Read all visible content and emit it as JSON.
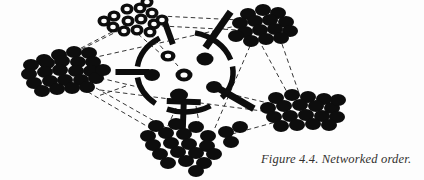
{
  "figure": {
    "caption": "Figure 4.4. Networked order.",
    "label": "Figure 4.4.",
    "title": "Networked order",
    "alt": "Networked order diagram: five peripheral clusters of dots linked by thin dashed lines around a central broken circle with thick radial spokes"
  },
  "colors": {
    "background": "#fdfdfd",
    "ink": "#0d0d0d",
    "dashed_line": "#2b2b2b",
    "caption_text": "#33312f",
    "ring_fill": "#fdfdfd"
  },
  "diagram": {
    "type": "network",
    "core": {
      "name": "central-hub",
      "center_x": 185,
      "center_y": 72,
      "radius_x": 48,
      "radius_y": 40,
      "arc_stroke_width": 5.5,
      "arcs": [
        {
          "name": "arc-top-right",
          "start_deg": -78,
          "end_deg": -18
        },
        {
          "name": "arc-right",
          "start_deg": -8,
          "end_deg": 40
        },
        {
          "name": "arc-bottom",
          "start_deg": 58,
          "end_deg": 112
        },
        {
          "name": "arc-left-lower",
          "start_deg": 128,
          "end_deg": 172
        },
        {
          "name": "arc-left-upper",
          "start_deg": 188,
          "end_deg": 238
        }
      ],
      "spokes": [
        {
          "name": "spoke-left",
          "angle_deg": 180,
          "length": 34,
          "width": 6,
          "cap_bar": false
        },
        {
          "name": "spoke-upper-left",
          "angle_deg": 250,
          "length": 26,
          "width": 6,
          "cap_bar": false
        },
        {
          "name": "spoke-upper-right",
          "angle_deg": 305,
          "length": 44,
          "width": 7,
          "cap_bar": false
        },
        {
          "name": "spoke-lower-right",
          "angle_deg": 30,
          "length": 44,
          "width": 7,
          "cap_bar": false
        },
        {
          "name": "spoke-bottom",
          "angle_deg": 92,
          "length": 34,
          "width": 6,
          "cap_bar": true
        }
      ],
      "inner_nodes": [
        {
          "name": "core-node-1",
          "x": 168,
          "y": 56,
          "rx": 7.5,
          "ry": 5.5,
          "style": "ring"
        },
        {
          "name": "core-node-2",
          "x": 205,
          "y": 59,
          "rx": 8.5,
          "ry": 6.5,
          "style": "solid"
        },
        {
          "name": "core-node-3",
          "x": 152,
          "y": 75,
          "rx": 8,
          "ry": 6,
          "style": "solid"
        },
        {
          "name": "core-node-4",
          "x": 184,
          "y": 75,
          "rx": 8.5,
          "ry": 6.5,
          "style": "ring"
        },
        {
          "name": "core-node-5",
          "x": 179,
          "y": 95,
          "rx": 9,
          "ry": 6.5,
          "style": "solid"
        },
        {
          "name": "core-node-6",
          "x": 214,
          "y": 87,
          "rx": 8,
          "ry": 6,
          "style": "solid"
        }
      ]
    },
    "clusters": [
      {
        "name": "cluster-top-rings",
        "style": "ring",
        "anchor_x": 140,
        "anchor_y": 22,
        "node_count": 14,
        "nodes": [
          {
            "x": 114,
            "y": 16,
            "rx": 6.5,
            "ry": 5.5
          },
          {
            "x": 127,
            "y": 9,
            "rx": 6.5,
            "ry": 5.5
          },
          {
            "x": 140,
            "y": 8,
            "rx": 6.5,
            "ry": 5.5
          },
          {
            "x": 152,
            "y": 13,
            "rx": 6.5,
            "ry": 5.5
          },
          {
            "x": 113,
            "y": 27,
            "rx": 6.5,
            "ry": 5.5
          },
          {
            "x": 128,
            "y": 21,
            "rx": 6.5,
            "ry": 5.5
          },
          {
            "x": 141,
            "y": 19,
            "rx": 6.5,
            "ry": 5.5
          },
          {
            "x": 154,
            "y": 24,
            "rx": 6.5,
            "ry": 5.5
          },
          {
            "x": 124,
            "y": 31,
            "rx": 6.5,
            "ry": 5.5
          },
          {
            "x": 137,
            "y": 30,
            "rx": 6.5,
            "ry": 5.5
          },
          {
            "x": 150,
            "y": 32,
            "rx": 6.5,
            "ry": 5.5
          },
          {
            "x": 162,
            "y": 20,
            "rx": 6.5,
            "ry": 5.5
          },
          {
            "x": 104,
            "y": 21,
            "rx": 6.5,
            "ry": 5.5
          },
          {
            "x": 147,
            "y": 2,
            "rx": 6.5,
            "ry": 5.5
          }
        ]
      },
      {
        "name": "cluster-left",
        "style": "solid",
        "anchor_x": 70,
        "anchor_y": 72,
        "node_count": 24,
        "nodes": [
          {
            "x": 44,
            "y": 60,
            "rx": 8,
            "ry": 6
          },
          {
            "x": 59,
            "y": 55,
            "rx": 8,
            "ry": 6
          },
          {
            "x": 74,
            "y": 52,
            "rx": 8,
            "ry": 6
          },
          {
            "x": 89,
            "y": 53,
            "rx": 8,
            "ry": 6
          },
          {
            "x": 31,
            "y": 65,
            "rx": 8,
            "ry": 6
          },
          {
            "x": 47,
            "y": 63,
            "rx": 8,
            "ry": 6
          },
          {
            "x": 62,
            "y": 61,
            "rx": 8,
            "ry": 6
          },
          {
            "x": 78,
            "y": 62,
            "rx": 8,
            "ry": 6
          },
          {
            "x": 93,
            "y": 62,
            "rx": 8,
            "ry": 6
          },
          {
            "x": 29,
            "y": 74,
            "rx": 8,
            "ry": 6
          },
          {
            "x": 45,
            "y": 72,
            "rx": 8,
            "ry": 6
          },
          {
            "x": 60,
            "y": 70,
            "rx": 8,
            "ry": 6
          },
          {
            "x": 76,
            "y": 71,
            "rx": 8,
            "ry": 6
          },
          {
            "x": 91,
            "y": 71,
            "rx": 8,
            "ry": 6
          },
          {
            "x": 34,
            "y": 83,
            "rx": 8,
            "ry": 6
          },
          {
            "x": 50,
            "y": 81,
            "rx": 8,
            "ry": 6
          },
          {
            "x": 65,
            "y": 80,
            "rx": 8,
            "ry": 6
          },
          {
            "x": 81,
            "y": 80,
            "rx": 8,
            "ry": 6
          },
          {
            "x": 96,
            "y": 78,
            "rx": 8,
            "ry": 6
          },
          {
            "x": 42,
            "y": 91,
            "rx": 8,
            "ry": 6
          },
          {
            "x": 57,
            "y": 89,
            "rx": 8,
            "ry": 6
          },
          {
            "x": 72,
            "y": 88,
            "rx": 8,
            "ry": 6
          },
          {
            "x": 87,
            "y": 87,
            "rx": 8,
            "ry": 6
          },
          {
            "x": 103,
            "y": 70,
            "rx": 8,
            "ry": 6
          }
        ]
      },
      {
        "name": "cluster-top-right",
        "style": "solid",
        "anchor_x": 262,
        "anchor_y": 28,
        "node_count": 15,
        "nodes": [
          {
            "x": 248,
            "y": 14,
            "rx": 8,
            "ry": 6
          },
          {
            "x": 263,
            "y": 10,
            "rx": 8,
            "ry": 6
          },
          {
            "x": 278,
            "y": 13,
            "rx": 8,
            "ry": 6
          },
          {
            "x": 240,
            "y": 23,
            "rx": 8,
            "ry": 6
          },
          {
            "x": 255,
            "y": 21,
            "rx": 8,
            "ry": 6
          },
          {
            "x": 270,
            "y": 20,
            "rx": 8,
            "ry": 6
          },
          {
            "x": 286,
            "y": 22,
            "rx": 8,
            "ry": 6
          },
          {
            "x": 245,
            "y": 32,
            "rx": 8,
            "ry": 6
          },
          {
            "x": 260,
            "y": 30,
            "rx": 8,
            "ry": 6
          },
          {
            "x": 275,
            "y": 29,
            "rx": 8,
            "ry": 6
          },
          {
            "x": 290,
            "y": 31,
            "rx": 8,
            "ry": 6
          },
          {
            "x": 251,
            "y": 41,
            "rx": 8,
            "ry": 6
          },
          {
            "x": 266,
            "y": 39,
            "rx": 8,
            "ry": 6
          },
          {
            "x": 281,
            "y": 38,
            "rx": 8,
            "ry": 6
          },
          {
            "x": 236,
            "y": 36,
            "rx": 8,
            "ry": 6
          }
        ]
      },
      {
        "name": "cluster-right",
        "style": "solid",
        "anchor_x": 300,
        "anchor_y": 110,
        "node_count": 19,
        "nodes": [
          {
            "x": 276,
            "y": 98,
            "rx": 8,
            "ry": 6
          },
          {
            "x": 292,
            "y": 95,
            "rx": 8,
            "ry": 6
          },
          {
            "x": 308,
            "y": 97,
            "rx": 8,
            "ry": 6
          },
          {
            "x": 324,
            "y": 99,
            "rx": 8,
            "ry": 6
          },
          {
            "x": 268,
            "y": 108,
            "rx": 8,
            "ry": 6
          },
          {
            "x": 284,
            "y": 106,
            "rx": 8,
            "ry": 6
          },
          {
            "x": 300,
            "y": 105,
            "rx": 8,
            "ry": 6
          },
          {
            "x": 316,
            "y": 106,
            "rx": 8,
            "ry": 6
          },
          {
            "x": 332,
            "y": 108,
            "rx": 8,
            "ry": 6
          },
          {
            "x": 274,
            "y": 117,
            "rx": 8,
            "ry": 6
          },
          {
            "x": 290,
            "y": 116,
            "rx": 8,
            "ry": 6
          },
          {
            "x": 306,
            "y": 115,
            "rx": 8,
            "ry": 6
          },
          {
            "x": 322,
            "y": 116,
            "rx": 8,
            "ry": 6
          },
          {
            "x": 337,
            "y": 117,
            "rx": 8,
            "ry": 6
          },
          {
            "x": 281,
            "y": 126,
            "rx": 8,
            "ry": 6
          },
          {
            "x": 297,
            "y": 125,
            "rx": 8,
            "ry": 6
          },
          {
            "x": 313,
            "y": 124,
            "rx": 8,
            "ry": 6
          },
          {
            "x": 329,
            "y": 125,
            "rx": 8,
            "ry": 6
          },
          {
            "x": 338,
            "y": 100,
            "rx": 8,
            "ry": 6
          }
        ]
      },
      {
        "name": "cluster-bottom",
        "style": "solid",
        "anchor_x": 185,
        "anchor_y": 145,
        "node_count": 22,
        "nodes": [
          {
            "x": 156,
            "y": 126,
            "rx": 8,
            "ry": 6
          },
          {
            "x": 176,
            "y": 124,
            "rx": 8,
            "ry": 6
          },
          {
            "x": 196,
            "y": 127,
            "rx": 8,
            "ry": 6
          },
          {
            "x": 148,
            "y": 136,
            "rx": 8,
            "ry": 6
          },
          {
            "x": 166,
            "y": 133,
            "rx": 8,
            "ry": 6
          },
          {
            "x": 184,
            "y": 134,
            "rx": 8,
            "ry": 6
          },
          {
            "x": 208,
            "y": 136,
            "rx": 8,
            "ry": 6
          },
          {
            "x": 226,
            "y": 132,
            "rx": 8,
            "ry": 6
          },
          {
            "x": 153,
            "y": 145,
            "rx": 8,
            "ry": 6
          },
          {
            "x": 171,
            "y": 143,
            "rx": 8,
            "ry": 6
          },
          {
            "x": 189,
            "y": 144,
            "rx": 8,
            "ry": 6
          },
          {
            "x": 207,
            "y": 146,
            "rx": 8,
            "ry": 6
          },
          {
            "x": 231,
            "y": 142,
            "rx": 8,
            "ry": 6
          },
          {
            "x": 160,
            "y": 154,
            "rx": 8,
            "ry": 6
          },
          {
            "x": 178,
            "y": 152,
            "rx": 8,
            "ry": 6
          },
          {
            "x": 196,
            "y": 153,
            "rx": 8,
            "ry": 6
          },
          {
            "x": 214,
            "y": 154,
            "rx": 8,
            "ry": 6
          },
          {
            "x": 168,
            "y": 163,
            "rx": 8,
            "ry": 6
          },
          {
            "x": 186,
            "y": 161,
            "rx": 8,
            "ry": 6
          },
          {
            "x": 204,
            "y": 163,
            "rx": 8,
            "ry": 6
          },
          {
            "x": 196,
            "y": 171,
            "rx": 8,
            "ry": 6
          },
          {
            "x": 240,
            "y": 127,
            "rx": 8,
            "ry": 6
          }
        ]
      }
    ],
    "links": [
      {
        "name": "link-top-to-left",
        "x1": 120,
        "y1": 30,
        "x2": 72,
        "y2": 54
      },
      {
        "name": "link-top-to-core-a",
        "x1": 138,
        "y1": 34,
        "x2": 168,
        "y2": 60
      },
      {
        "name": "link-top-to-core-b",
        "x1": 150,
        "y1": 34,
        "x2": 178,
        "y2": 66
      },
      {
        "name": "link-top-to-topright",
        "x1": 160,
        "y1": 16,
        "x2": 240,
        "y2": 20
      },
      {
        "name": "link-top-to-topright-2",
        "x1": 162,
        "y1": 26,
        "x2": 238,
        "y2": 30
      },
      {
        "name": "link-topright-to-right",
        "x1": 282,
        "y1": 44,
        "x2": 300,
        "y2": 96
      },
      {
        "name": "link-topright-to-right-2",
        "x1": 262,
        "y1": 46,
        "x2": 288,
        "y2": 94
      },
      {
        "name": "link-topright-to-bottom",
        "x1": 250,
        "y1": 46,
        "x2": 214,
        "y2": 130
      },
      {
        "name": "link-left-to-bottom",
        "x1": 96,
        "y1": 88,
        "x2": 170,
        "y2": 130
      },
      {
        "name": "link-left-to-bottom-2",
        "x1": 88,
        "y1": 92,
        "x2": 150,
        "y2": 128
      },
      {
        "name": "link-left-to-core",
        "x1": 100,
        "y1": 78,
        "x2": 142,
        "y2": 88
      },
      {
        "name": "link-left-to-right",
        "x1": 100,
        "y1": 90,
        "x2": 270,
        "y2": 112
      },
      {
        "name": "link-core-to-right",
        "x1": 222,
        "y1": 92,
        "x2": 272,
        "y2": 104
      },
      {
        "name": "link-core-to-bottom",
        "x1": 176,
        "y1": 108,
        "x2": 166,
        "y2": 130
      },
      {
        "name": "link-core-to-bottom-2",
        "x1": 196,
        "y1": 106,
        "x2": 200,
        "y2": 128
      },
      {
        "name": "link-bottom-to-right",
        "x1": 232,
        "y1": 134,
        "x2": 276,
        "y2": 122
      },
      {
        "name": "link-left-to-topright",
        "x1": 92,
        "y1": 58,
        "x2": 236,
        "y2": 26
      },
      {
        "name": "link-top-long-left",
        "x1": 112,
        "y1": 32,
        "x2": 62,
        "y2": 58
      },
      {
        "name": "link-core-left-down",
        "x1": 126,
        "y1": 86,
        "x2": 98,
        "y2": 96
      }
    ]
  }
}
